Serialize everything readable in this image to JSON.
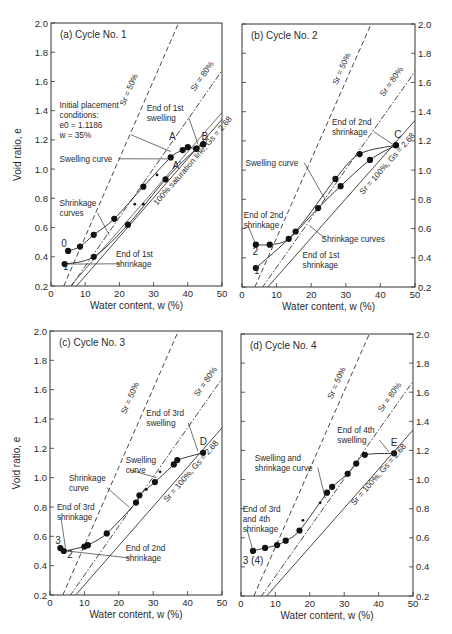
{
  "chart_data": [
    {
      "type": "scatter",
      "title": "(a) Cycle No. 1",
      "xlabel": "Water content, w (%)",
      "ylabel": "Void ratio, e",
      "xlim": [
        0,
        50
      ],
      "ylim": [
        0.2,
        2.0
      ],
      "xticks": [
        "0",
        "10",
        "20",
        "30",
        "40",
        "50"
      ],
      "yticks": [
        "0.2",
        "0.4",
        "0.6",
        "0.8",
        "1.0",
        "1.2",
        "1.4",
        "1.6",
        "1.8",
        "2.0"
      ],
      "yaxis_side": "left",
      "reference_lines": [
        {
          "name": "Sr = 50%",
          "style": "dashed",
          "slope": 0.0536
        },
        {
          "name": "Sr = 80%",
          "style": "dash-dot",
          "slope": 0.0335
        },
        {
          "name": "100% saturation line, Gs = 2.68",
          "style": "solid",
          "slope": 0.0268
        }
      ],
      "series": [
        {
          "name": "Shrinkage curve from 0",
          "points": [
            [
              5,
              0.44
            ],
            [
              8.5,
              0.47
            ],
            [
              12.5,
              0.55
            ],
            [
              18.5,
              0.66
            ],
            [
              27,
              0.88
            ],
            [
              35,
              1.08
            ],
            [
              38.5,
              1.13
            ],
            [
              40,
              1.15
            ],
            [
              42.5,
              1.14
            ],
            [
              44.5,
              1.17
            ]
          ]
        },
        {
          "name": "Curve from 1",
          "points": [
            [
              4,
              0.35
            ],
            [
              12.5,
              0.4
            ],
            [
              22.5,
              0.62
            ],
            [
              33.5,
              0.93
            ],
            [
              42.5,
              1.14
            ],
            [
              44.5,
              1.17
            ]
          ]
        }
      ],
      "small_points": [
        [
          24.5,
          0.76
        ],
        [
          27,
          0.76
        ],
        [
          31,
          0.96
        ]
      ],
      "point_labels": [
        {
          "text": "0",
          "at": [
            3,
            0.47
          ]
        },
        {
          "text": "1",
          "at": [
            3.5,
            0.31
          ]
        },
        {
          "text": "A",
          "at": [
            34.5,
            1.2
          ]
        },
        {
          "text": "A'",
          "at": [
            35.5,
            1.0
          ]
        },
        {
          "text": "B",
          "at": [
            44,
            1.2
          ]
        }
      ],
      "annotations": [
        {
          "text": [
            "Initial placement",
            "conditions:",
            "e0 = 1.1186",
            "w = 35%"
          ],
          "at": [
            2.5,
            1.42
          ],
          "target": [
            35,
            1.12
          ]
        },
        {
          "text": [
            "End of 1st",
            "swelling"
          ],
          "at": [
            28,
            1.4
          ],
          "target": [
            43,
            1.17
          ]
        },
        {
          "text": [
            "Swelling curve"
          ],
          "at": [
            2.5,
            1.05
          ],
          "target": [
            35.5,
            1.07
          ]
        },
        {
          "text": [
            "Shrinkage",
            "curves"
          ],
          "at": [
            2.5,
            0.75
          ],
          "target": [
            17,
            0.55
          ]
        },
        {
          "text": [
            "End of 1st",
            "shrinkage"
          ],
          "at": [
            19,
            0.4
          ],
          "target": [
            5,
            0.35
          ]
        }
      ],
      "line_labels": [
        {
          "text": "Sr = 50%",
          "at": [
            21.5,
            1.43
          ]
        },
        {
          "text": "Sr = 80%",
          "at": [
            42,
            1.53
          ]
        },
        {
          "text": "100% saturation line, Gs = 2.68",
          "at": [
            31,
            0.75
          ]
        }
      ]
    },
    {
      "type": "scatter",
      "title": "(b) Cycle No. 2",
      "xlabel": "Water content, w (%)",
      "ylabel": "",
      "xlim": [
        0,
        50
      ],
      "ylim": [
        0.2,
        2.0
      ],
      "xticks": [
        "0",
        "10",
        "20",
        "30",
        "40",
        "50"
      ],
      "yticks": [
        "0.2",
        "0.4",
        "0.6",
        "0.8",
        "1.0",
        "1.2",
        "1.4",
        "1.6",
        "1.8",
        "2.0"
      ],
      "yaxis_side": "right",
      "reference_lines": [
        {
          "name": "Sr = 50%",
          "style": "dashed",
          "slope": 0.0536
        },
        {
          "name": "Sr = 80%",
          "style": "dash-dot",
          "slope": 0.0335
        },
        {
          "name": "Sr = 100%, Gs = 2.68",
          "style": "solid",
          "slope": 0.0268
        }
      ],
      "series": [
        {
          "name": "Swelling curve",
          "points": [
            [
              4,
              0.33
            ],
            [
              15.5,
              0.58
            ],
            [
              27,
              0.94
            ],
            [
              34,
              1.11
            ],
            [
              44.5,
              1.17
            ]
          ]
        },
        {
          "name": "Shrinkage curve",
          "points": [
            [
              44.5,
              1.17
            ],
            [
              37,
              1.07
            ],
            [
              28.5,
              0.89
            ],
            [
              22,
              0.74
            ],
            [
              13.5,
              0.53
            ],
            [
              8,
              0.49
            ],
            [
              4,
              0.49
            ]
          ]
        }
      ],
      "small_points": [],
      "point_labels": [
        {
          "text": "2",
          "at": [
            3,
            0.42
          ]
        },
        {
          "text": "1",
          "at": [
            3.5,
            0.29
          ]
        },
        {
          "text": "C",
          "at": [
            44,
            1.22
          ]
        }
      ],
      "annotations": [
        {
          "text": [
            "End of 2nd",
            "shrinkage"
          ],
          "at": [
            26,
            1.31
          ],
          "target": [
            44,
            1.17
          ]
        },
        {
          "text": [
            "Swelling curve"
          ],
          "at": [
            1,
            1.03
          ],
          "target": [
            24,
            0.8
          ]
        },
        {
          "text": [
            "End of 2nd",
            "shrinkage"
          ],
          "at": [
            0.5,
            0.67
          ],
          "target": [
            4,
            0.49
          ]
        },
        {
          "text": [
            "Shrinkage curves"
          ],
          "at": [
            23,
            0.51
          ],
          "target": [
            19.5,
            0.62
          ]
        },
        {
          "text": [
            "End of 1st",
            "shrinkage"
          ],
          "at": [
            17.5,
            0.4
          ],
          "target": [
            0,
            0
          ]
        }
      ],
      "line_labels": [
        {
          "text": "Sr = 50%",
          "at": [
            27.5,
            1.58
          ]
        },
        {
          "text": "Sr = 80%",
          "at": [
            41,
            1.5
          ]
        },
        {
          "text": "Sr = 100%, Gs = 2.68",
          "at": [
            35,
            0.83
          ]
        }
      ]
    },
    {
      "type": "scatter",
      "title": "(c) Cycle No. 3",
      "xlabel": "Water content, w (%)",
      "ylabel": "Void ratio, e",
      "xlim": [
        0,
        50
      ],
      "ylim": [
        0.2,
        2.0
      ],
      "xticks": [
        "0",
        "10",
        "20",
        "30",
        "40",
        "50"
      ],
      "yticks": [
        "0.2",
        "0.4",
        "0.6",
        "0.8",
        "1.0",
        "1.2",
        "1.4",
        "1.6",
        "1.8",
        "2.0"
      ],
      "yaxis_side": "left",
      "reference_lines": [
        {
          "name": "Sr = 50%",
          "style": "dashed",
          "slope": 0.0536
        },
        {
          "name": "Sr = 80%",
          "style": "dash-dot",
          "slope": 0.0335
        },
        {
          "name": "Sr = 100%, Gs = 2.68",
          "style": "solid",
          "slope": 0.0268
        }
      ],
      "series": [
        {
          "name": "Swelling/shrinkage curve",
          "points": [
            [
              3,
              0.52
            ],
            [
              4,
              0.5
            ],
            [
              10,
              0.53
            ],
            [
              11,
              0.54
            ],
            [
              16.5,
              0.62
            ],
            [
              25,
              0.83
            ],
            [
              26,
              0.88
            ],
            [
              30.5,
              0.97
            ],
            [
              36,
              1.09
            ],
            [
              37,
              1.12
            ],
            [
              44.5,
              1.17
            ]
          ]
        }
      ],
      "small_points": [
        [
          28,
          0.92
        ],
        [
          32,
          1.04
        ]
      ],
      "point_labels": [
        {
          "text": "3",
          "at": [
            1.5,
            0.55
          ]
        },
        {
          "text": "2",
          "at": [
            5,
            0.45
          ]
        },
        {
          "text": "D",
          "at": [
            43.5,
            1.22
          ]
        }
      ],
      "annotations": [
        {
          "text": [
            "End of 3rd",
            "swelling"
          ],
          "at": [
            28,
            1.42
          ],
          "target": [
            43,
            1.18
          ]
        },
        {
          "text": [
            "Swelling",
            "curve"
          ],
          "at": [
            22,
            1.1
          ],
          "target": [
            31,
            1.0
          ]
        },
        {
          "text": [
            "Shrinkage",
            "curve"
          ],
          "at": [
            5.5,
            0.98
          ],
          "target": [
            23,
            0.8
          ]
        },
        {
          "text": [
            "End of 3rd",
            "shrinkage"
          ],
          "at": [
            2,
            0.78
          ],
          "target": [
            4.5,
            0.52
          ]
        },
        {
          "text": [
            "End of 2nd",
            "shrinkage"
          ],
          "at": [
            22,
            0.5
          ],
          "target": [
            5,
            0.5
          ]
        }
      ],
      "line_labels": [
        {
          "text": "Sr = 50%",
          "at": [
            22,
            1.43
          ]
        },
        {
          "text": "Sr = 80%",
          "at": [
            43,
            1.55
          ]
        },
        {
          "text": "Sr = 100%, Gs = 2.68",
          "at": [
            34,
            0.83
          ]
        }
      ]
    },
    {
      "type": "scatter",
      "title": "(d) Cycle No. 4",
      "xlabel": "Water content, w (%)",
      "ylabel": "",
      "xlim": [
        0,
        50
      ],
      "ylim": [
        0.2,
        2.0
      ],
      "xticks": [
        "0",
        "10",
        "20",
        "30",
        "40",
        "50"
      ],
      "yticks": [
        "0.2",
        "0.4",
        "0.6",
        "0.8",
        "1.0",
        "1.2",
        "1.4",
        "1.6",
        "1.8",
        "2.0"
      ],
      "yaxis_side": "right",
      "reference_lines": [
        {
          "name": "Sr = 50%",
          "style": "dashed",
          "slope": 0.0536
        },
        {
          "name": "Sr = 80%",
          "style": "dash-dot",
          "slope": 0.0335
        },
        {
          "name": "Sr = 100%, Gs = 2.68",
          "style": "solid",
          "slope": 0.0268
        }
      ],
      "series": [
        {
          "name": "Swelling and shrinkage curve",
          "points": [
            [
              3.5,
              0.51
            ],
            [
              7,
              0.53
            ],
            [
              10.5,
              0.55
            ],
            [
              13,
              0.58
            ],
            [
              17,
              0.65
            ],
            [
              25,
              0.91
            ],
            [
              26.5,
              0.95
            ],
            [
              31,
              1.04
            ],
            [
              33.5,
              1.11
            ],
            [
              36,
              1.17
            ],
            [
              44.5,
              1.18
            ]
          ]
        }
      ],
      "small_points": [
        [
          18,
          0.72
        ],
        [
          23,
          0.84
        ]
      ],
      "point_labels": [
        {
          "text": "3 (4)",
          "at": [
            0.5,
            0.42
          ]
        },
        {
          "text": "E",
          "at": [
            43.5,
            1.23
          ]
        }
      ],
      "annotations": [
        {
          "text": [
            "End of 4th",
            "swelling"
          ],
          "at": [
            28,
            1.32
          ],
          "target": [
            43,
            1.19
          ]
        },
        {
          "text": [
            "Swelling and",
            "shrinkage curve"
          ],
          "at": [
            4,
            1.13
          ],
          "target": [
            24.5,
            0.87
          ]
        },
        {
          "text": [
            "End of 3rd",
            "and 4th",
            "shrinkage"
          ],
          "at": [
            0.5,
            0.78
          ],
          "target": [
            3.5,
            0.51
          ]
        }
      ],
      "line_labels": [
        {
          "text": "Sr = 50%",
          "at": [
            26.5,
            1.55
          ]
        },
        {
          "text": "Sr = 80%",
          "at": [
            41,
            1.46
          ]
        },
        {
          "text": "Sr = 100%, Gs = 2.68",
          "at": [
            33,
            0.82
          ]
        }
      ]
    }
  ]
}
